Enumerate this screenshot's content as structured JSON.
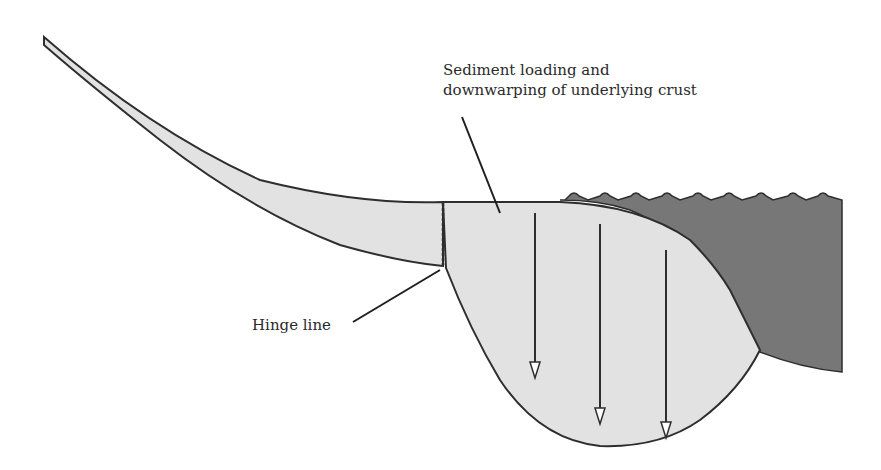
{
  "diagram": {
    "title": "",
    "labels": {
      "sediment_line1": "Sediment loading and",
      "sediment_line2": "downwarping of underlying crust",
      "hinge": "Hinge line"
    },
    "colors": {
      "sediment_fill": "#e2e2e2",
      "ocean_fill": "#777777",
      "outline": "#2e2e2e",
      "background": "#ffffff"
    },
    "elements": {
      "arrows_count": 3,
      "wave_crests": 9
    }
  }
}
